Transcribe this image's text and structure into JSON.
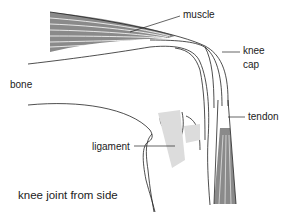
{
  "diagram": {
    "labels": {
      "muscle": "muscle",
      "knee_cap_line1": "knee",
      "knee_cap_line2": "cap",
      "bone": "bone",
      "tendon": "tendon",
      "ligament": "ligament"
    },
    "caption": "knee joint from side",
    "colors": {
      "line": "#222222",
      "muscle_fill": "#8a8a8a",
      "ligament_fill": "#d8d8d8"
    }
  }
}
